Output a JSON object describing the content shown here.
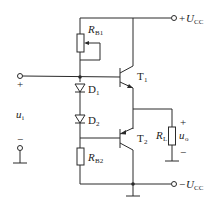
{
  "diagram": {
    "type": "circuit-schematic",
    "components": {
      "rb1": {
        "label": "R",
        "sub": "B1"
      },
      "rb2": {
        "label": "R",
        "sub": "B2"
      },
      "d1": {
        "label": "D",
        "sub": "1"
      },
      "d2": {
        "label": "D",
        "sub": "2"
      },
      "t1": {
        "label": "T",
        "sub": "1"
      },
      "t2": {
        "label": "T",
        "sub": "2"
      },
      "rl": {
        "label": "R",
        "sub": "L"
      }
    },
    "terminals": {
      "vcc_pos": {
        "prefix": "+",
        "label": "U",
        "sub": "CC"
      },
      "vcc_neg": {
        "prefix": "−",
        "label": "U",
        "sub": "CC"
      },
      "input": {
        "label": "u",
        "sub": "i",
        "plus": "+",
        "minus": "−"
      },
      "output": {
        "label": "u",
        "sub": "o",
        "plus": "+",
        "minus": "−"
      }
    }
  }
}
